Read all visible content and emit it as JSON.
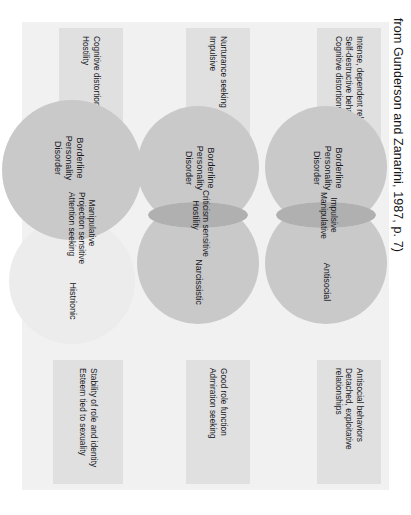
{
  "credit": "from Gunderson and Zanarini, 1987, p. 7)",
  "left_chips": [
    {
      "lines": [
        "Intense, dependent relationships",
        "Self-destructive behaviors",
        "Cognitive distortions"
      ]
    },
    {
      "lines": [
        "Nurturance seeking",
        "Impulsive"
      ]
    },
    {
      "lines": [
        "Cognitive distortions",
        "Hostility"
      ]
    }
  ],
  "right_chips": [
    {
      "lines": [
        "Antisocial behaviors",
        "Detached, exploitative",
        "relationships"
      ]
    },
    {
      "lines": [
        "Good role function",
        "Admiration seeking"
      ]
    },
    {
      "lines": [
        "Stability of role and identity",
        "Esteem tied to sexuality"
      ]
    }
  ],
  "venns": [
    {
      "left_label": "Borderline\nPersonality\nDisorder",
      "overlap_label": "Impulsive\nManipulative",
      "right_label": "Antisocial"
    },
    {
      "left_label": "Borderline\nPersonality\nDisorder",
      "overlap_label": "Criticism sensitive\nHostility",
      "right_label": "Narcissistic"
    },
    {
      "left_label": "Borderline\nPersonality\nDisorder",
      "overlap_label": "Manipulative\nProjection sensitive\nAttention seeking",
      "right_label": "Histrionic"
    }
  ],
  "colors": {
    "page_background": "#ffffff",
    "panel_background": "#f1f1f2",
    "chip_background": "#e0e0e1",
    "circle_fill": "#c9c9ca",
    "circle_fill_faint": "#ececec",
    "overlap_fill": "#b0b0b1",
    "text": "#15161a"
  }
}
